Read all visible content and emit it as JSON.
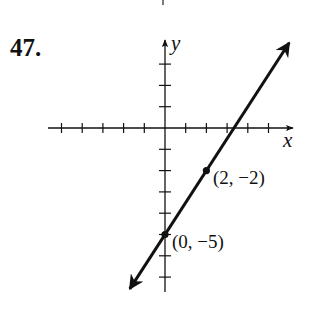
{
  "problem_number": "47.",
  "chart_data": {
    "type": "line",
    "title": "",
    "xlabel": "x",
    "ylabel": "y",
    "xlim": [
      -5,
      6
    ],
    "ylim": [
      -8,
      4
    ],
    "grid": false,
    "x_ticks": [
      -5,
      -4,
      -3,
      -2,
      -1,
      1,
      2,
      3,
      4,
      5
    ],
    "y_ticks": [
      3,
      2,
      1,
      -1,
      -2,
      -3,
      -4,
      -5,
      -6,
      -7
    ],
    "series": [
      {
        "name": "line",
        "equation": "y = (3/2)x - 5",
        "slope": 1.5,
        "intercept": -5,
        "x": [
          -1.7,
          6.0
        ],
        "y": [
          -7.55,
          4.0
        ],
        "arrows": "both"
      }
    ],
    "points": [
      {
        "x": 2,
        "y": -2,
        "label": "(2, −2)"
      },
      {
        "x": 0,
        "y": -5,
        "label": "(0, −5)"
      }
    ]
  },
  "labels": {
    "x_axis": "x",
    "y_axis": "y",
    "point_a": "(2, −2)",
    "point_b": "(0, −5)"
  }
}
